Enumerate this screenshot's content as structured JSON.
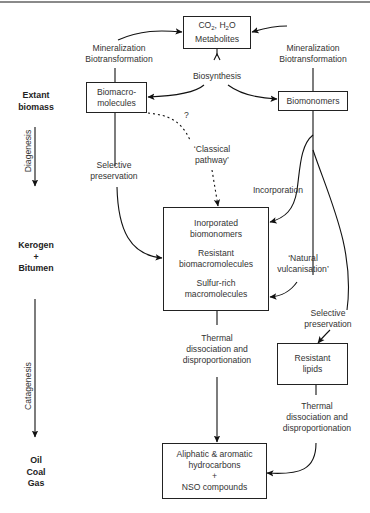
{
  "diagram": {
    "stages": [
      {
        "id": "extant",
        "lines": [
          "Extant",
          "biomass"
        ]
      },
      {
        "id": "kerogen",
        "lines": [
          "Kerogen",
          "+",
          "Bitumen"
        ]
      },
      {
        "id": "oil",
        "lines": [
          "Oil",
          "Coal",
          "Gas"
        ]
      }
    ],
    "stage_processes": [
      {
        "id": "diagenesis",
        "label": "Diagenesis"
      },
      {
        "id": "catagenesis",
        "label": "Catagenesis"
      }
    ],
    "nodes": {
      "co2": {
        "line1_a": "CO",
        "line1_sub1": "2",
        "line1_b": ", H",
        "line1_sub2": "2",
        "line1_c": "O",
        "line2": "Metabolites"
      },
      "biomacromolecules": {
        "lines": [
          "Biomacro-",
          "molecules"
        ]
      },
      "biomonomers": {
        "label": "Biomonomers"
      },
      "kerogen_box": {
        "groups": [
          [
            "Inorporated",
            "biomonomers"
          ],
          [
            "Resistant",
            "biomacromolecules"
          ],
          [
            "Sulfur-rich",
            "macromolecules"
          ]
        ]
      },
      "resistant_lipids": {
        "lines": [
          "Resistant",
          "lipids"
        ]
      },
      "products": {
        "lines": [
          "Aliphatic & aromatic",
          "hydrocarbons",
          "+",
          "NSO compounds"
        ]
      }
    },
    "edge_labels": {
      "mineralization_left": [
        "Mineralization",
        "Biotransformation"
      ],
      "mineralization_right": [
        "Mineralization",
        "Biotransformation"
      ],
      "biosynthesis": "Biosynthesis",
      "question": "?",
      "classical_pathway": [
        "‘Classical",
        "pathway’"
      ],
      "selective_preservation_left": [
        "Selective",
        "preservation"
      ],
      "incorporation": "Incorporation",
      "natural_vulcanisation": [
        "‘Natural",
        "vulcanisation’"
      ],
      "selective_preservation_right": [
        "Selective",
        "preservation"
      ],
      "thermal_center": [
        "Thermal",
        "dissociation and",
        "disproportionation"
      ],
      "thermal_right": [
        "Thermal",
        "dissociation and",
        "disproportionation"
      ]
    }
  }
}
